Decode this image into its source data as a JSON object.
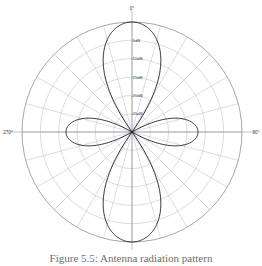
{
  "figure": {
    "caption": "Figure 5.5: Antenna radiation pattern"
  },
  "chart_data": {
    "type": "line",
    "plot_style": "polar",
    "title": "",
    "subtitle": "",
    "xlabel": "",
    "ylabel": "",
    "grid": true,
    "legend_position": "none",
    "angle_unit": "degrees",
    "angle_direction": "clockwise",
    "angle_zero_location": "top",
    "angle_tick_labels": [
      "0°",
      "90°",
      "180°",
      "270°"
    ],
    "angle_tick_values": [
      0,
      90,
      180,
      270
    ],
    "angle_spoke_interval_deg": 15,
    "radial_tick_labels": [
      "-5dB",
      "-10dB",
      "-15dB",
      "-20dB",
      "-25dB"
    ],
    "radial_tick_values": [
      -5,
      -10,
      -15,
      -20,
      -25
    ],
    "radial_ring_count": 6,
    "rlim": [
      -30,
      0
    ],
    "radial_unit": "dB",
    "series": [
      {
        "name": "radiation pattern",
        "color": "#1d1d1d",
        "lobes": [
          {
            "name": "main-lobe-up",
            "center_deg": 0,
            "peak_db": 0,
            "half_width_deg": 22
          },
          {
            "name": "main-lobe-down",
            "center_deg": 180,
            "peak_db": 0,
            "half_width_deg": 22
          },
          {
            "name": "side-lobe-right",
            "center_deg": 90,
            "peak_db": -12,
            "half_width_deg": 22
          },
          {
            "name": "side-lobe-left",
            "center_deg": 270,
            "peak_db": -12,
            "half_width_deg": 22
          }
        ],
        "description": "Four-lobe pattern: two large lobes along 0°/180° reaching 0 dB, two smaller lobes along 90°/270° reaching about -12 dB, with deep nulls at 45°, 135°, 225° and 315°."
      }
    ]
  },
  "colors": {
    "trace": "#1d1d1d",
    "grid": "#b9b9c4",
    "grid_outer": "#8f8f9b",
    "background": "#ffffff",
    "caption": "#6e6e6e"
  }
}
